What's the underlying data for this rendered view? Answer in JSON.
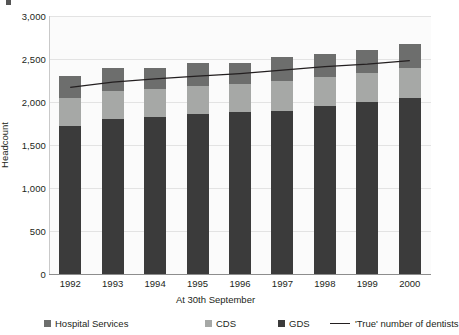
{
  "chart_data": {
    "type": "bar",
    "subtype": "stacked-bar-with-line",
    "title": "",
    "xlabel": "At 30th September",
    "ylabel": "Headcount",
    "categories": [
      "1992",
      "1993",
      "1994",
      "1995",
      "1996",
      "1997",
      "1998",
      "1999",
      "2000"
    ],
    "ylim": [
      0,
      3000
    ],
    "yticks": [
      0,
      500,
      1000,
      1500,
      2000,
      2500,
      3000
    ],
    "ytick_labels": [
      "0",
      "500",
      "1,000",
      "1,500",
      "2,000",
      "2,500",
      "3,000"
    ],
    "grid": true,
    "legend_position": "bottom",
    "series": [
      {
        "name": "GDS",
        "kind": "bar",
        "color": "#3b3b3b",
        "values": [
          1720,
          1800,
          1820,
          1860,
          1880,
          1900,
          1950,
          2000,
          2050
        ]
      },
      {
        "name": "CDS",
        "kind": "bar",
        "color": "#a6a8a6",
        "values": [
          330,
          330,
          330,
          330,
          330,
          340,
          340,
          340,
          350
        ]
      },
      {
        "name": "Hospital Services",
        "kind": "bar",
        "color": "#6d6e6d",
        "values": [
          250,
          270,
          250,
          260,
          240,
          280,
          270,
          260,
          270
        ]
      },
      {
        "name": "'True' number of dentists",
        "kind": "line",
        "color": "#231f20",
        "values": [
          2170,
          2230,
          2270,
          2300,
          2330,
          2370,
          2410,
          2440,
          2480
        ]
      }
    ],
    "stack_totals": [
      2300,
      2400,
      2400,
      2450,
      2450,
      2520,
      2560,
      2600,
      2670
    ]
  },
  "axis": {
    "ylabel": "Headcount",
    "xlabel": "At 30th September",
    "ytick_labels": [
      "3,000",
      "2,500",
      "2,000",
      "1,500",
      "1,000",
      "500",
      "0"
    ],
    "xtick_labels": [
      "1992",
      "1993",
      "1994",
      "1995",
      "1996",
      "1997",
      "1998",
      "1999",
      "2000"
    ]
  },
  "legend": {
    "items": [
      {
        "label": "Hospital Services",
        "swatch": "#6d6e6d",
        "type": "swatch"
      },
      {
        "label": "CDS",
        "swatch": "#a6a8a6",
        "type": "swatch"
      },
      {
        "label": "GDS",
        "swatch": "#3b3b3b",
        "type": "swatch"
      },
      {
        "label": "'True' number of dentists",
        "swatch": "#231f20",
        "type": "line"
      }
    ]
  },
  "colors": {
    "gds": "#3b3b3b",
    "cds": "#a6a8a6",
    "hospital": "#6d6e6d",
    "line": "#231f20",
    "grid": "#e3e3e3",
    "plot_bg": "#fbfbfb"
  }
}
